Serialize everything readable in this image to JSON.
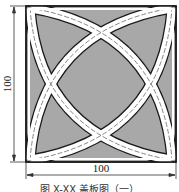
{
  "figure": {
    "dimensions": {
      "width_label": "100",
      "height_label": "100"
    },
    "caption": "图 X-XX 盖板图（一）",
    "colors": {
      "fill": "#a8a8a8",
      "outline": "#1a1a1a",
      "band": "#ffffff",
      "centerline": "#555555"
    }
  }
}
